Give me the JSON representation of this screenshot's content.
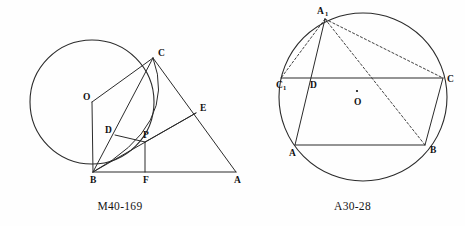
{
  "page": {
    "background_color": "#fefefe",
    "ink_color": "#2b2b2b",
    "width": 465,
    "height": 226
  },
  "figures": [
    {
      "id": "M40-169",
      "caption": "M40-169",
      "description": "Circle with center O tangent to line BA at B; right triangle CBA with cevians through D and P and point E on CA; arc from C through P to B.",
      "circle": {
        "cx": 92,
        "cy": 102,
        "r": 62
      },
      "points": [
        {
          "name": "O",
          "label": "O",
          "x": 92,
          "y": 102,
          "label_dx": -9,
          "label_dy": -2,
          "marked": false
        },
        {
          "name": "C",
          "label": "C",
          "x": 153,
          "y": 58,
          "label_dx": 5,
          "label_dy": -2,
          "marked": false
        },
        {
          "name": "B",
          "label": "B",
          "x": 93,
          "y": 172,
          "label_dx": -3,
          "label_dy": 11,
          "marked": false
        },
        {
          "name": "A",
          "label": "A",
          "x": 236,
          "y": 172,
          "label_dx": -2,
          "label_dy": 11,
          "marked": false
        },
        {
          "name": "D",
          "label": "D",
          "x": 115,
          "y": 135,
          "label_dx": -10,
          "label_dy": -2,
          "marked": false
        },
        {
          "name": "P",
          "label": "P",
          "x": 145,
          "y": 142,
          "label_dx": -2,
          "label_dy": -4,
          "marked": false
        },
        {
          "name": "E",
          "label": "E",
          "x": 196,
          "y": 113,
          "label_dx": 4,
          "label_dy": -2,
          "marked": false
        },
        {
          "name": "F",
          "label": "F",
          "x": 145,
          "y": 172,
          "label_dx": -2,
          "label_dy": 11,
          "marked": false
        }
      ],
      "segments": [
        {
          "from": "B",
          "to": "A",
          "style": "solid"
        },
        {
          "from": "B",
          "to": "C",
          "style": "solid"
        },
        {
          "from": "C",
          "to": "A",
          "style": "solid"
        },
        {
          "from": "O",
          "to": "C",
          "style": "solid"
        },
        {
          "from": "O",
          "to": "B",
          "style": "solid"
        },
        {
          "from": "D",
          "to": "P",
          "style": "solid"
        },
        {
          "from": "P",
          "to": "E",
          "style": "solid"
        },
        {
          "from": "P",
          "to": "F",
          "style": "solid"
        },
        {
          "from": "B",
          "to": "E",
          "style": "solid"
        }
      ],
      "arcs": [
        {
          "name": "arc-C-P-B",
          "from": "C",
          "to": "B",
          "bulge": 13,
          "style": "solid"
        }
      ]
    },
    {
      "id": "A30-28",
      "caption": "A30-28",
      "description": "Circle with center O and inscribed parallelogram-like figure ABCD with reflected vertex A1; dashed chords A1-C1, A1-C and A1-B.",
      "circle": {
        "cx": 363,
        "cy": 97,
        "r": 84
      },
      "points": [
        {
          "name": "A1",
          "label": "A",
          "sub": "1",
          "x": 325,
          "y": 19,
          "label_dx": -6,
          "label_dy": -4,
          "marked": false
        },
        {
          "name": "C1",
          "label": "C",
          "sub": "1",
          "x": 281,
          "y": 78,
          "label_dx": -1,
          "label_dy": 10,
          "marked": false
        },
        {
          "name": "D",
          "label": "D",
          "x": 313,
          "y": 78,
          "label_dx": 1,
          "label_dy": 10,
          "marked": false
        },
        {
          "name": "C",
          "label": "C",
          "x": 443,
          "y": 78,
          "label_dx": 4,
          "label_dy": 4,
          "marked": false
        },
        {
          "name": "A",
          "label": "A",
          "x": 295,
          "y": 145,
          "label_dx": -4,
          "label_dy": 11,
          "marked": false
        },
        {
          "name": "B",
          "label": "B",
          "x": 425,
          "y": 145,
          "label_dx": 5,
          "label_dy": 8,
          "marked": false
        },
        {
          "name": "O",
          "label": "O",
          "x": 357,
          "y": 95,
          "label_dx": 0,
          "label_dy": 10,
          "marked": true
        }
      ],
      "segments": [
        {
          "from": "C1",
          "to": "C",
          "style": "solid"
        },
        {
          "from": "A",
          "to": "B",
          "style": "solid"
        },
        {
          "from": "A",
          "to": "A1",
          "style": "solid"
        },
        {
          "from": "B",
          "to": "C",
          "style": "solid"
        },
        {
          "from": "A1",
          "to": "C1",
          "style": "dashed"
        },
        {
          "from": "A1",
          "to": "C",
          "style": "dashed"
        },
        {
          "from": "A1",
          "to": "B",
          "style": "dashed"
        }
      ],
      "arcs": []
    }
  ]
}
